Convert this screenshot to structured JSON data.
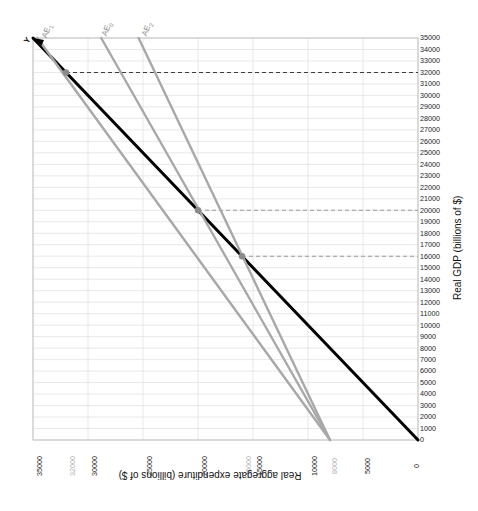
{
  "chart_data": {
    "type": "line",
    "title": "",
    "xlabel": "Real aggregate expenditure (billions of $)",
    "ylabel": "Real GDP (billions of $)",
    "orientation": "x-axis reversed (35000 at left, 0 at right); axis titles rendered upside-down; y-axis on right side",
    "xlim": [
      35000,
      0
    ],
    "ylim": [
      0,
      35000
    ],
    "grid": true,
    "legend": "none (curves labelled in-place)",
    "x_ticks": [
      {
        "value": 35000,
        "label": "35000",
        "muted": false
      },
      {
        "value": 32000,
        "label": "32000",
        "muted": true
      },
      {
        "value": 30000,
        "label": "30000",
        "muted": false
      },
      {
        "value": 25000,
        "label": "25000",
        "muted": false
      },
      {
        "value": 20000,
        "label": "20000",
        "muted": false
      },
      {
        "value": 16000,
        "label": "16000",
        "muted": true
      },
      {
        "value": 15000,
        "label": "15000",
        "muted": false
      },
      {
        "value": 10000,
        "label": "10000",
        "muted": false
      },
      {
        "value": 8000,
        "label": "8000",
        "muted": true
      },
      {
        "value": 5000,
        "label": "5000",
        "muted": false
      },
      {
        "value": 0,
        "label": "0",
        "muted": false
      }
    ],
    "y_ticks": [
      {
        "value": 35000,
        "label": "35000"
      },
      {
        "value": 34000,
        "label": "34000"
      },
      {
        "value": 33000,
        "label": "33000"
      },
      {
        "value": 32000,
        "label": "32000"
      },
      {
        "value": 31000,
        "label": "31000"
      },
      {
        "value": 30000,
        "label": "30000"
      },
      {
        "value": 29000,
        "label": "29000"
      },
      {
        "value": 28000,
        "label": "28000"
      },
      {
        "value": 27000,
        "label": "27000"
      },
      {
        "value": 26000,
        "label": "26000"
      },
      {
        "value": 25000,
        "label": "25000"
      },
      {
        "value": 24000,
        "label": "24000"
      },
      {
        "value": 23000,
        "label": "23000"
      },
      {
        "value": 22000,
        "label": "22000"
      },
      {
        "value": 21000,
        "label": "21000"
      },
      {
        "value": 20000,
        "label": "20000"
      },
      {
        "value": 19000,
        "label": "19000"
      },
      {
        "value": 18000,
        "label": "18000"
      },
      {
        "value": 17000,
        "label": "17000"
      },
      {
        "value": 16000,
        "label": "16000"
      },
      {
        "value": 15000,
        "label": "15000"
      },
      {
        "value": 14000,
        "label": "14000"
      },
      {
        "value": 13000,
        "label": "13000"
      },
      {
        "value": 12000,
        "label": "12000"
      },
      {
        "value": 11000,
        "label": "11000"
      },
      {
        "value": 10000,
        "label": "10000"
      },
      {
        "value": 9000,
        "label": "9000"
      },
      {
        "value": 8000,
        "label": "8000"
      },
      {
        "value": 7000,
        "label": "7000"
      },
      {
        "value": 6000,
        "label": "6000"
      },
      {
        "value": 5000,
        "label": "5000"
      },
      {
        "value": 4000,
        "label": "4000"
      },
      {
        "value": 3000,
        "label": "3000"
      },
      {
        "value": 2000,
        "label": "2000"
      },
      {
        "value": 1000,
        "label": "1000"
      },
      {
        "value": 0,
        "label": "0"
      }
    ],
    "series": [
      {
        "name": "Y",
        "label": "Y",
        "color": "#000000",
        "width": 3,
        "description": "45-degree line: real aggregate expenditure = real GDP",
        "points": [
          [
            35000,
            35000
          ],
          [
            0,
            0
          ]
        ]
      },
      {
        "name": "AE1",
        "label": "AE",
        "sub": "1",
        "color": "#a8a8a8",
        "width": 2.4,
        "description": "Aggregate expenditure line intersecting the 45-degree line at 32000",
        "points": [
          [
            34600,
            35000
          ],
          [
            8000,
            0
          ]
        ]
      },
      {
        "name": "AE0",
        "label": "AE",
        "sub": "0",
        "color": "#a8a8a8",
        "width": 2.4,
        "description": "Aggregate expenditure line intersecting the 45-degree line at 20000",
        "points": [
          [
            28800,
            35000
          ],
          [
            8000,
            0
          ]
        ]
      },
      {
        "name": "AE2",
        "label": "AE",
        "sub": "2",
        "color": "#a8a8a8",
        "width": 2.4,
        "description": "Aggregate expenditure line intersecting the 45-degree line at 16000",
        "points": [
          [
            25400,
            35000
          ],
          [
            8000,
            0
          ]
        ]
      }
    ],
    "equilibria": [
      {
        "name": "equilibrium-1",
        "x": 32000,
        "y": 32000,
        "guide": "dashed",
        "curve": "AE1"
      },
      {
        "name": "equilibrium-0",
        "x": 20000,
        "y": 20000,
        "guide": "dashed",
        "curve": "AE0"
      },
      {
        "name": "equilibrium-2",
        "x": 16000,
        "y": 16000,
        "guide": "dashed",
        "curve": "AE2"
      }
    ],
    "guide_lines": [
      {
        "value": 32000,
        "style": "dashed",
        "color": "#3c3c3c"
      },
      {
        "value": 20000,
        "style": "dashed",
        "color": "#9a9a9a"
      },
      {
        "value": 16000,
        "style": "dashed",
        "color": "#9a9a9a"
      }
    ],
    "colors": {
      "grid": "#e2e2e2",
      "axis": "#bdbdbd",
      "line_45": "#000000",
      "ae_line": "#a8a8a8",
      "marker": "#8a8a8a",
      "text": "#1d1d1d",
      "muted_text": "#a8a8a8"
    }
  }
}
